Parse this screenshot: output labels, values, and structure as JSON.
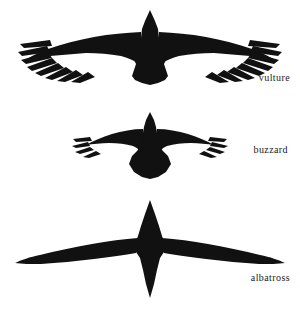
{
  "figure": {
    "background_color": "#ffffff",
    "silhouette_color": "#111111",
    "label_color": "#1a1a1a"
  },
  "birds": [
    {
      "id": "vulture",
      "label": "vulture",
      "icon": "vulture-silhouette-icon",
      "wing_shape": "broad, deeply fingered primaries",
      "primary_fingers_per_wing": 8,
      "tail_shape": "short broad fan",
      "wingspan_px": 264,
      "relative_wingspan": 1.0
    },
    {
      "id": "buzzard",
      "label": "buzzard",
      "icon": "buzzard-silhouette-icon",
      "wing_shape": "short and broad with blunt fingered tips",
      "primary_fingers_per_wing": 4,
      "tail_shape": "short rounded fan",
      "wingspan_px": 156,
      "relative_wingspan": 0.59
    },
    {
      "id": "albatross",
      "label": "albatross",
      "icon": "albatross-silhouette-icon",
      "wing_shape": "very long, narrow and tapering, no fingers",
      "primary_fingers_per_wing": 0,
      "tail_shape": "long pointed wedge",
      "wingspan_px": 272,
      "relative_wingspan": 1.03
    }
  ]
}
